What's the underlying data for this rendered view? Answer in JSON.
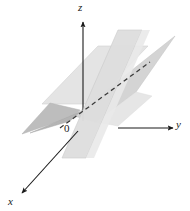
{
  "figure": {
    "background_color": "#ffffff",
    "width": 190,
    "height": 211
  },
  "axes": {
    "origin_label": "0",
    "z": {
      "label": "z",
      "direction": "up",
      "arrow": true
    },
    "y": {
      "label": "y",
      "direction": "right",
      "arrow": true
    },
    "x": {
      "label": "x",
      "direction": "down-left",
      "arrow": true
    },
    "line_color": "#1a1a1a"
  },
  "planes": [
    {
      "name": "vertical-plane-back",
      "fill": "#e2e2e2",
      "stroke": "#cfcfcf",
      "description": "light gray vertical parallelogram, rear"
    },
    {
      "name": "vertical-plane-front",
      "fill": "#dcdcdc",
      "stroke": "#c8c8c8",
      "description": "light gray vertical parallelogram, front"
    },
    {
      "name": "slanted-plane-right",
      "fill": "#d2d2d2",
      "stroke": "#bcbcbc",
      "description": "slanted plane wedge rising to the upper right"
    },
    {
      "name": "slanted-plane-left",
      "fill": "#b2b2b2",
      "stroke": "#a6a6a6",
      "description": "darker slanted plane wedge extending to the lower left"
    }
  ],
  "intersection_line": {
    "name": "dashed-intersection-line",
    "style": "dashed",
    "color": "#3a3a3a",
    "description": "dashed line of intersection of the two planes"
  },
  "colors": {
    "ink": "#1a1a1a",
    "light_gray": "#e2e2e2",
    "mid_gray": "#d2d2d2",
    "dark_gray": "#b2b2b2",
    "background": "#ffffff"
  }
}
